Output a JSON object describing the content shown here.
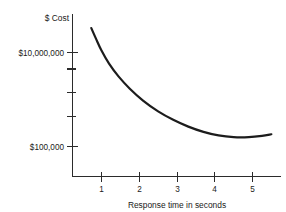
{
  "chart_data": {
    "type": "line",
    "title": "",
    "xlabel": "Response time in seconds",
    "ylabel": "$ Cost",
    "yscale": "log",
    "xlim": [
      0,
      5.9
    ],
    "ylim": [
      100000,
      100000000
    ],
    "grid": false,
    "legend": null,
    "x_ticks": [
      {
        "value": 1,
        "label": "1"
      },
      {
        "value": 2,
        "label": "2"
      },
      {
        "value": 3,
        "label": "3"
      },
      {
        "value": 4,
        "label": "4"
      },
      {
        "value": 5,
        "label": "5"
      }
    ],
    "y_ticks": [
      {
        "value": 10000000,
        "label": "$10,000,000"
      },
      {
        "value": 3000000,
        "label": ""
      },
      {
        "value": 1000000,
        "label": ""
      },
      {
        "value": 300000,
        "label": ""
      },
      {
        "value": 100000,
        "label": "$100,000"
      }
    ],
    "series": [
      {
        "name": "Cost vs response time",
        "x": [
          0.73,
          0.85,
          1.0,
          1.2,
          1.45,
          1.75,
          2.1,
          2.5,
          2.9,
          3.3,
          3.7,
          4.1,
          4.5,
          4.9,
          5.25,
          5.5
        ],
        "y": [
          33000000,
          20000000,
          11000000,
          5800000,
          3100000,
          1700000,
          950000,
          560000,
          370000,
          265000,
          205000,
          172000,
          158000,
          158000,
          168000,
          182000
        ]
      }
    ]
  },
  "colors": {
    "curve": "#1c1c1c",
    "axis": "#2b2b2b",
    "text": "#1a1a1a",
    "background": "#ffffff"
  }
}
